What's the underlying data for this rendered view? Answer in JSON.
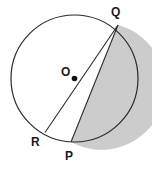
{
  "figure": {
    "background_color": "#ffffff",
    "stroke_color": "#2b2b2b",
    "shaded_fill_color": "#cccccc",
    "shaded_region_name": "segment-PQ-major-arc",
    "circle": {
      "center_x": 74.5,
      "center_y": 78.5,
      "radius": 63.5,
      "stroke_width": 1.2
    },
    "center_dot": {
      "cx": 74.5,
      "cy": 78.5,
      "r": 2.8,
      "color": "#101010"
    },
    "points": {
      "Q": {
        "x": 118.0,
        "y": 25.0
      },
      "P": {
        "x": 71.0,
        "y": 142.0
      },
      "R": {
        "x": 45.0,
        "y": 132.5
      }
    },
    "segments": [
      {
        "name": "line-Q-to-R-through-O",
        "from": "Q",
        "to": "R"
      },
      {
        "name": "chord-Q-to-P",
        "from": "Q",
        "to": "P"
      }
    ],
    "labels": {
      "Q": "Q",
      "O": "O",
      "P": "P",
      "R": "R"
    }
  }
}
